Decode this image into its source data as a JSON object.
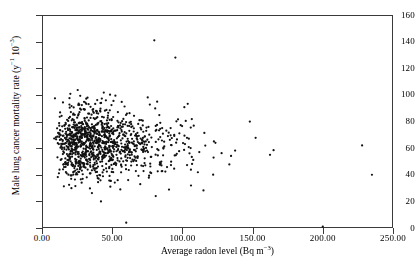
{
  "chart_data": {
    "type": "scatter",
    "title": "",
    "xlabel": "Average radon level (Bq m−3)",
    "ylabel": "Male lung cancer mortality rate (y−1 10−3)",
    "xlabel_parts": {
      "text": "Average radon level (Bq m",
      "sup": "−3",
      "tail": ")"
    },
    "ylabel_parts": {
      "text": "Male lung cancer mortality rate (y",
      "sup1": "−1",
      "mid": " 10",
      "sup2": "−3",
      "tail": ")"
    },
    "xlim": [
      0,
      250
    ],
    "ylim": [
      0,
      160
    ],
    "xticks": [
      0,
      50,
      100,
      150,
      200,
      250
    ],
    "yticks": [
      0,
      20,
      40,
      60,
      80,
      100,
      120,
      140,
      160
    ],
    "xtick_labels": [
      "0.00",
      "50.00",
      "100.00",
      "150.00",
      "200.00",
      "250.00"
    ],
    "ytick_labels": [
      "0",
      "20",
      "40",
      "60",
      "80",
      "100",
      "120",
      "140",
      "160"
    ],
    "grid": false,
    "legend": null,
    "marker": {
      "shape": "dot",
      "size": 1.8,
      "color": "#111111"
    },
    "n_points": 1150,
    "point_color": "#111111",
    "frame_color": "#3a3a3a",
    "cluster": {
      "x_center": 38,
      "y_center": 64,
      "x_spread": 22,
      "y_spread": 13,
      "x_min": 8,
      "x_max": 240,
      "y_min": 4,
      "y_max": 141
    },
    "outliers": [
      {
        "x": 80,
        "y": 141
      },
      {
        "x": 95,
        "y": 128
      },
      {
        "x": 42,
        "y": 20
      },
      {
        "x": 60,
        "y": 4
      },
      {
        "x": 228,
        "y": 62
      },
      {
        "x": 235,
        "y": 40
      },
      {
        "x": 200,
        "y": 1
      }
    ]
  }
}
